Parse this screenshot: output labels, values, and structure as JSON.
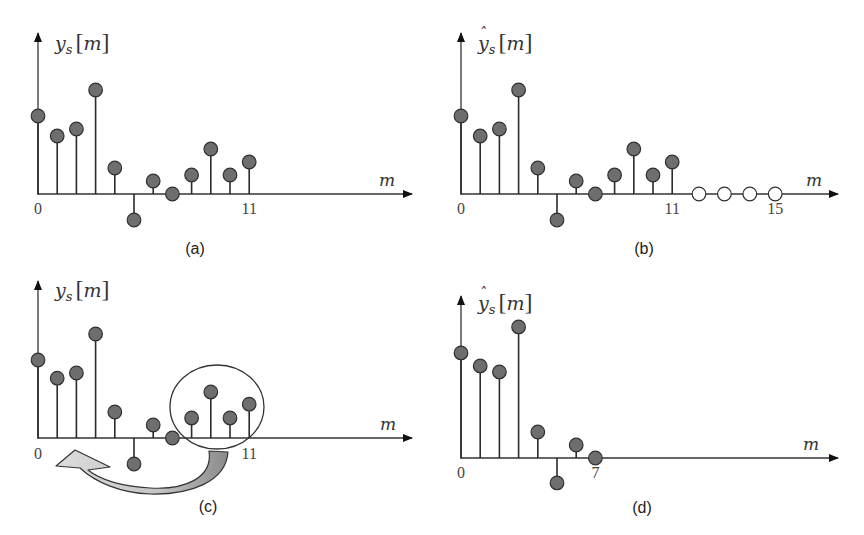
{
  "chart_data": [
    {
      "type": "stem",
      "panel": "a",
      "caption": "(a)",
      "ylabel_base": "y",
      "ylabel_sub": "s",
      "ylabel_arg": "m",
      "ylabel_hat": false,
      "xlabel": "m",
      "x_tick_labels": [
        {
          "m": 0,
          "text": "0"
        },
        {
          "m": 11,
          "text": "11"
        }
      ],
      "x": [
        0,
        1,
        2,
        3,
        4,
        5,
        6,
        7,
        8,
        9,
        10,
        11
      ],
      "values": [
        3.0,
        2.23,
        2.5,
        4.0,
        1.0,
        -1.0,
        0.5,
        0,
        0.73,
        1.73,
        0.73,
        1.23
      ],
      "zero_padded": []
    },
    {
      "type": "stem",
      "panel": "b",
      "caption": "(b)",
      "ylabel_base": "y",
      "ylabel_sub": "s",
      "ylabel_arg": "m",
      "ylabel_hat": true,
      "xlabel": "m",
      "x_tick_labels": [
        {
          "m": 0,
          "text": "0"
        },
        {
          "m": 11,
          "text": "11"
        },
        {
          "m": 15,
          "text": "15"
        }
      ],
      "x": [
        0,
        1,
        2,
        3,
        4,
        5,
        6,
        7,
        8,
        9,
        10,
        11
      ],
      "values": [
        3.0,
        2.23,
        2.5,
        4.0,
        1.0,
        -1.0,
        0.5,
        0,
        0.73,
        1.73,
        0.73,
        1.23
      ],
      "zero_padded": [
        12,
        13,
        14,
        15
      ]
    },
    {
      "type": "stem",
      "panel": "c",
      "caption": "(c)",
      "ylabel_base": "y",
      "ylabel_sub": "s",
      "ylabel_arg": "m",
      "ylabel_hat": false,
      "xlabel": "m",
      "x_tick_labels": [
        {
          "m": 0,
          "text": "0"
        },
        {
          "m": 11,
          "text": "11"
        }
      ],
      "x": [
        0,
        1,
        2,
        3,
        4,
        5,
        6,
        7,
        8,
        9,
        10,
        11
      ],
      "values": [
        3.0,
        2.3,
        2.5,
        4.0,
        1.0,
        -1.0,
        0.5,
        0,
        0.77,
        1.77,
        0.77,
        1.3
      ],
      "annotation": {
        "highlight": "samples 8-11 circled",
        "arrow": "wrap to start (m=0)"
      },
      "zero_padded": []
    },
    {
      "type": "stem",
      "panel": "d",
      "caption": "(d)",
      "ylabel_base": "y",
      "ylabel_sub": "s",
      "ylabel_arg": "m",
      "ylabel_hat": true,
      "xlabel": "m",
      "x_tick_labels": [
        {
          "m": 0,
          "text": "0"
        },
        {
          "m": 7,
          "text": "7"
        }
      ],
      "x": [
        0,
        1,
        2,
        3,
        4,
        5,
        6,
        7
      ],
      "values": [
        4.04,
        3.54,
        3.31,
        5.04,
        1.0,
        -0.96,
        0.5,
        0
      ],
      "zero_padded": []
    }
  ]
}
